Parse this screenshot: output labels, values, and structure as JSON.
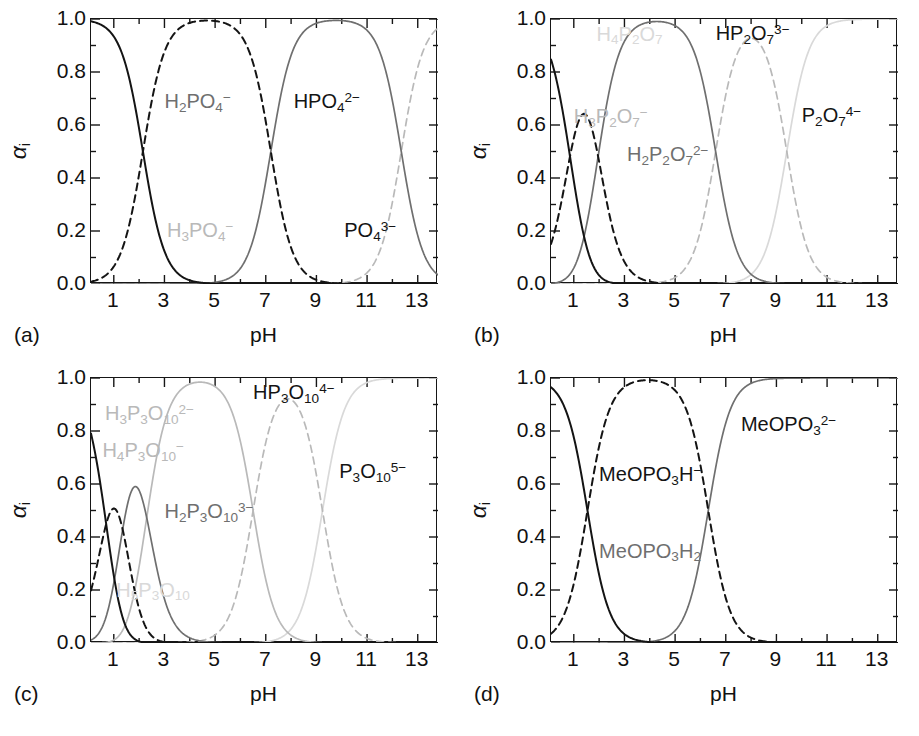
{
  "figure": {
    "panels": [
      "a",
      "b",
      "c",
      "d"
    ],
    "axis": {
      "ylabel": "α",
      "ylabel_sub": "i",
      "xlabel": "pH",
      "yticks": [
        "0.0",
        "0.2",
        "0.4",
        "0.6",
        "0.8",
        "1.0"
      ],
      "ytick_values": [
        0.0,
        0.2,
        0.4,
        0.6,
        0.8,
        1.0
      ],
      "xticks": [
        "1",
        "3",
        "5",
        "7",
        "9",
        "11",
        "13"
      ],
      "xtick_values": [
        1,
        3,
        5,
        7,
        9,
        11,
        13
      ],
      "xlim": [
        0.1,
        13.8
      ],
      "ylim": [
        0.0,
        1.0
      ],
      "yminor_step": 0.1,
      "xminor_step": 1
    },
    "colors": {
      "dark": "#141414",
      "gray": "#6f6f6f",
      "light": "#b9b9b9",
      "xlight": "#d9d9d9",
      "frame": "#161616",
      "background": "#ffffff"
    }
  },
  "chart_data": [
    {
      "type": "line",
      "panel": "a",
      "panel_label": "(a)",
      "title": "",
      "xlabel": "pH",
      "ylabel": "αi",
      "xlim": [
        0.1,
        13.8
      ],
      "ylim": [
        0.0,
        1.0
      ],
      "grid": false,
      "legend": "inline-annotations",
      "system": "H3PO4",
      "pka": [
        2.15,
        7.2,
        12.35
      ],
      "series": [
        {
          "name": "H3PO4",
          "label_html": "H<sub>3</sub>PO<sub>4</sub><sup>−</sup>",
          "label_x": 3.1,
          "label_y": 0.21,
          "style": "dashed",
          "tone": "light",
          "protons": 3,
          "charge": 0
        },
        {
          "name": "H2PO4-",
          "label_html": "H<sub>2</sub>PO<sub>4</sub><sup>−</sup>",
          "label_x": 3.0,
          "label_y": 0.7,
          "style": "solid",
          "tone": "gray",
          "protons": 2,
          "charge": -1
        },
        {
          "name": "HPO4 2-",
          "label_html": "HPO<sub>4</sub><sup>2−</sup>",
          "label_x": 8.1,
          "label_y": 0.7,
          "style": "dashed",
          "tone": "dark",
          "protons": 1,
          "charge": -2
        },
        {
          "name": "PO4 3-",
          "label_html": "PO<sub>4</sub><sup>3−</sup>",
          "label_x": 10.1,
          "label_y": 0.21,
          "style": "solid",
          "tone": "dark",
          "protons": 0,
          "charge": -3
        }
      ]
    },
    {
      "type": "line",
      "panel": "b",
      "panel_label": "(b)",
      "title": "",
      "xlabel": "pH",
      "ylabel": "αi",
      "xlim": [
        0.1,
        13.8
      ],
      "ylim": [
        0.0,
        1.0
      ],
      "grid": false,
      "legend": "inline-annotations",
      "system": "H4P2O7",
      "pka": [
        0.85,
        1.96,
        6.6,
        9.41
      ],
      "series": [
        {
          "name": "H4P2O7",
          "label_html": "H<sub>4</sub>P<sub>2</sub>O<sub>7</sub>",
          "label_x": 1.9,
          "label_y": 0.94,
          "style": "solid",
          "tone": "xlight",
          "protons": 4,
          "charge": 0
        },
        {
          "name": "H3P2O7-",
          "label_html": "H<sub>3</sub>P<sub>2</sub>O<sub>7</sub><sup>−</sup>",
          "label_x": 1.0,
          "label_y": 0.64,
          "style": "dashed",
          "tone": "light",
          "protons": 3,
          "charge": -1
        },
        {
          "name": "H2P2O7 2-",
          "label_html": "H<sub>2</sub>P<sub>2</sub>O<sub>7</sub><sup>2−</sup>",
          "label_x": 3.1,
          "label_y": 0.5,
          "style": "solid",
          "tone": "gray",
          "protons": 2,
          "charge": -2
        },
        {
          "name": "HP2O7 3-",
          "label_html": "HP<sub>2</sub>O<sub>7</sub><sup>3−</sup>",
          "label_x": 6.6,
          "label_y": 0.955,
          "style": "dashed",
          "tone": "dark",
          "protons": 1,
          "charge": -3
        },
        {
          "name": "P2O7 4-",
          "label_html": "P<sub>2</sub>O<sub>7</sub><sup>4−</sup>",
          "label_x": 10.0,
          "label_y": 0.645,
          "style": "solid",
          "tone": "dark",
          "protons": 0,
          "charge": -4
        }
      ]
    },
    {
      "type": "line",
      "panel": "c",
      "panel_label": "(c)",
      "title": "",
      "xlabel": "pH",
      "ylabel": "αi",
      "xlim": [
        0.1,
        13.8
      ],
      "ylim": [
        0.0,
        1.0
      ],
      "grid": false,
      "legend": "inline-annotations",
      "system": "H5P3O10",
      "pka": [
        0.7,
        1.35,
        2.3,
        6.5,
        9.24
      ],
      "series": [
        {
          "name": "H5P3O10",
          "label_html": "H<sub>5</sub>P<sub>3</sub>O<sub>10</sub>",
          "label_x": 1.1,
          "label_y": 0.195,
          "style": "solid",
          "tone": "xlight",
          "protons": 5,
          "charge": 0
        },
        {
          "name": "H4P3O10-",
          "label_html": "H<sub>4</sub>P<sub>3</sub>O<sub>10</sub><sup>−</sup>",
          "label_x": 0.55,
          "label_y": 0.735,
          "style": "dashed",
          "tone": "light",
          "protons": 4,
          "charge": -1
        },
        {
          "name": "H3P3O10 2-",
          "label_html": "H<sub>3</sub>P<sub>3</sub>O<sub>10</sub><sup>2−</sup>",
          "label_x": 0.65,
          "label_y": 0.875,
          "style": "solid",
          "tone": "light",
          "protons": 3,
          "charge": -2
        },
        {
          "name": "H2P3O10 3-",
          "label_html": "H<sub>2</sub>P<sub>3</sub>O<sub>10</sub><sup>3−</sup>",
          "label_x": 3.0,
          "label_y": 0.505,
          "style": "solid",
          "tone": "gray",
          "protons": 2,
          "charge": -3
        },
        {
          "name": "HP3O10 4-",
          "label_html": "HP<sub>3</sub>O<sub>10</sub><sup>4−</sup>",
          "label_x": 6.5,
          "label_y": 0.955,
          "style": "dashed",
          "tone": "dark",
          "protons": 1,
          "charge": -4
        },
        {
          "name": "P3O10 5-",
          "label_html": "P<sub>3</sub>O<sub>10</sub><sup>5−</sup>",
          "label_x": 9.9,
          "label_y": 0.655,
          "style": "solid",
          "tone": "dark",
          "protons": 0,
          "charge": -5
        }
      ]
    },
    {
      "type": "line",
      "panel": "d",
      "panel_label": "(d)",
      "title": "",
      "xlabel": "pH",
      "ylabel": "αi",
      "xlim": [
        0.1,
        13.8
      ],
      "ylim": [
        0.0,
        1.0
      ],
      "grid": false,
      "legend": "inline-annotations",
      "system": "MeOPO3H2",
      "pka": [
        1.54,
        6.31
      ],
      "series": [
        {
          "name": "MeOPO3H2",
          "label_html": "MeOPO<sub>3</sub>H<sub>2</sub>",
          "label_x": 2.0,
          "label_y": 0.345,
          "style": "solid",
          "tone": "gray",
          "protons": 2,
          "charge": 0
        },
        {
          "name": "MeOPO3H-",
          "label_html": "MeOPO<sub>3</sub>H<sup>−</sup>",
          "label_x": 2.0,
          "label_y": 0.645,
          "style": "dashed",
          "tone": "dark",
          "protons": 1,
          "charge": -1
        },
        {
          "name": "MeOPO3 2-",
          "label_html": "MeOPO<sub>3</sub><sup>2−</sup>",
          "label_x": 7.6,
          "label_y": 0.835,
          "style": "solid",
          "tone": "dark",
          "protons": 0,
          "charge": -2
        }
      ]
    }
  ]
}
